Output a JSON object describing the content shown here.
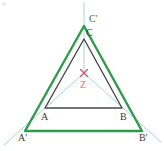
{
  "figure": {
    "canvas": {
      "width": 164,
      "height": 151
    },
    "colors": {
      "inner_triangle": "#4a4a4a",
      "outer_triangle": "#2e9c4a",
      "rays": "#a9d4ea",
      "center_mark": "#cf4f6d",
      "label_dark": "#3a3a3a",
      "label_green": "#2f7d3a",
      "label_pink": "#e06a7a",
      "background": "#ffffff"
    },
    "inner_triangle": {
      "name": "ABC",
      "stroke_width": 1.4,
      "vertices": [
        {
          "id": "A",
          "label": "A",
          "x": 45,
          "y": 108
        },
        {
          "id": "B",
          "label": "B",
          "x": 122,
          "y": 108
        },
        {
          "id": "C",
          "label": "C",
          "x": 84,
          "y": 39
        }
      ]
    },
    "outer_triangle": {
      "name": "A'B'C'",
      "stroke_width": 2.4,
      "vertices": [
        {
          "id": "Ap",
          "label": "A'",
          "x": 25,
          "y": 131
        },
        {
          "id": "Bp",
          "label": "B'",
          "x": 142,
          "y": 131
        },
        {
          "id": "Cp",
          "label": "C'",
          "x": 84,
          "y": 26
        }
      ]
    },
    "center": {
      "id": "Z",
      "label": "Z",
      "x": 84,
      "y": 73,
      "marker": "x-cross",
      "marker_size": 4
    },
    "rays": {
      "stroke_width": 1,
      "description": "Light blue rays from center Z through each pair of corresponding vertices, extended beyond the outer triangle",
      "segments": [
        {
          "id": "ray-Z-A",
          "from": "Z",
          "through": "A",
          "x1": 84,
          "y1": 73,
          "x2": 4,
          "y2": 145
        },
        {
          "id": "ray-Z-B",
          "from": "Z",
          "through": "B",
          "x1": 84,
          "y1": 73,
          "x2": 161,
          "y2": 142
        },
        {
          "id": "ray-Z-C",
          "from": "Z",
          "through": "C",
          "x1": 84,
          "y1": 73,
          "x2": 84,
          "y2": 3
        }
      ]
    },
    "labels": [
      {
        "id": "label-Cp",
        "text": "C'",
        "color": "green",
        "x": 89,
        "y": 14
      },
      {
        "id": "label-C",
        "text": "C",
        "color": "dark",
        "x": 86,
        "y": 28
      },
      {
        "id": "label-Z",
        "text": "Z",
        "color": "pink",
        "x": 80,
        "y": 80
      },
      {
        "id": "label-A",
        "text": "A",
        "color": "dark",
        "x": 41,
        "y": 112
      },
      {
        "id": "label-B",
        "text": "B",
        "color": "dark",
        "x": 120,
        "y": 112
      },
      {
        "id": "label-Ap",
        "text": "A'",
        "color": "dark",
        "x": 18,
        "y": 133
      },
      {
        "id": "label-Bp",
        "text": "B'",
        "color": "dark",
        "x": 139,
        "y": 133
      }
    ]
  }
}
